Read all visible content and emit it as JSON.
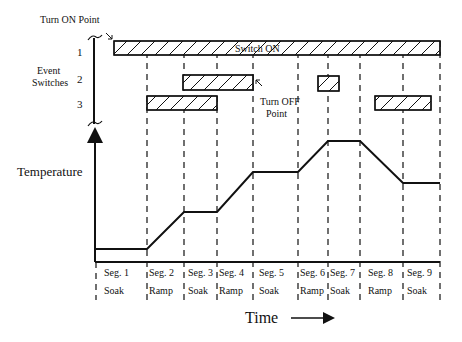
{
  "labels": {
    "turn_on_point": "Turn ON Point",
    "event_switches_line1": "Event",
    "event_switches_line2": "Switches",
    "switch_numbers": [
      "1",
      "2",
      "3"
    ],
    "switch_on": "Switch ON",
    "turn_off_line1": "Turn OFF",
    "turn_off_line2": "Point",
    "temperature": "Temperature",
    "time": "Time"
  },
  "segments": [
    {
      "name": "Seg. 1",
      "type": "Soak"
    },
    {
      "name": "Seg. 2",
      "type": "Ramp"
    },
    {
      "name": "Seg. 3",
      "type": "Soak"
    },
    {
      "name": "Seg. 4",
      "type": "Ramp"
    },
    {
      "name": "Seg. 5",
      "type": "Soak"
    },
    {
      "name": "Seg. 6",
      "type": "Ramp"
    },
    {
      "name": "Seg. 7",
      "type": "Soak"
    },
    {
      "name": "Seg. 8",
      "type": "Ramp"
    },
    {
      "name": "Seg. 9",
      "type": "Soak"
    }
  ],
  "colors": {
    "line": "#111111",
    "background": "#ffffff"
  }
}
